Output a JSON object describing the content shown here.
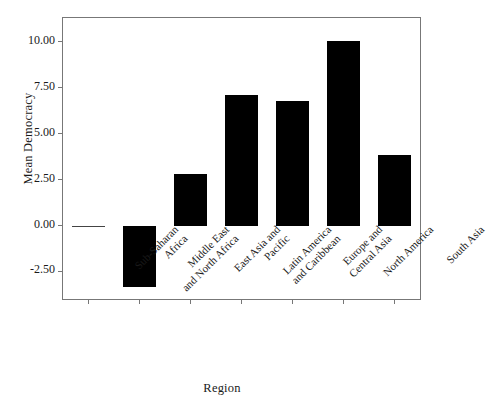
{
  "chart_data": {
    "type": "bar",
    "title": "",
    "xlabel": "Region",
    "ylabel": "Mean Democracy",
    "categories": [
      "Sub-Saharan Africa",
      "Middle East and North Africa",
      "East Asia and Pacific",
      "Latin America and Caribbean",
      "Europe and Central Asia",
      "North America",
      "South Asia"
    ],
    "category_lines": [
      [
        "Sub-Saharan",
        "Africa"
      ],
      [
        "Middle East",
        "and North Africa"
      ],
      [
        "East Asia and",
        "Pacific"
      ],
      [
        "Latin America",
        "and Caribbean"
      ],
      [
        "Europe and",
        "Central Asia"
      ],
      [
        "North America",
        ""
      ],
      [
        "South Asia",
        ""
      ]
    ],
    "values": [
      0.0,
      -3.35,
      2.8,
      7.1,
      6.8,
      10.05,
      3.85
    ],
    "ylim": [
      -4.0,
      11.3
    ],
    "yticks": [
      -2.5,
      0.0,
      2.5,
      5.0,
      7.5,
      10.0
    ],
    "ytick_labels": [
      "-2.50",
      "0.00",
      "2.50",
      "5.00",
      "7.50",
      "10.00"
    ],
    "grid": false,
    "legend": false,
    "bar_color": "#000000",
    "axis_color": "#777777"
  }
}
